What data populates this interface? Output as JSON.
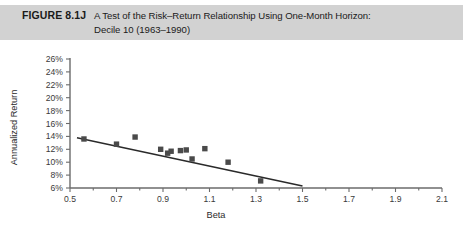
{
  "figure": {
    "number": "FIGURE 8.1J",
    "caption_line1": "A Test of the Risk–Return Relationship Using One-Month Horizon:",
    "caption_line2": "Decile 10 (1963–1990)",
    "header_bg": "#d2d2d2"
  },
  "chart_data": {
    "type": "scatter",
    "title": "A Test of the Risk–Return Relationship Using One-Month Horizon: Decile 10 (1963–1990)",
    "xlabel": "Beta",
    "ylabel": "Annualized Return",
    "xlim": [
      0.5,
      2.1
    ],
    "ylim": [
      6,
      26
    ],
    "grid": false,
    "legend": null,
    "x_ticks": [
      0.5,
      0.7,
      0.9,
      1.1,
      1.3,
      1.5,
      1.7,
      1.9,
      2.1
    ],
    "x_tick_labels": [
      "0.5",
      "0.7",
      "0.9",
      "1.1",
      "1.3",
      "1.5",
      "1.7",
      "1.9",
      "2.1"
    ],
    "x_minor_ticks": [
      0.6,
      0.8,
      1.0,
      1.2,
      1.4,
      1.6,
      1.8,
      2.0
    ],
    "y_ticks": [
      6,
      8,
      10,
      12,
      14,
      16,
      18,
      20,
      22,
      24,
      26
    ],
    "y_tick_labels": [
      "6%",
      "8%",
      "10%",
      "12%",
      "14%",
      "16%",
      "18%",
      "20%",
      "22%",
      "24%",
      "26%"
    ],
    "marker_color": "#4a4a4a",
    "marker_shape": "square",
    "points": [
      {
        "x": 0.56,
        "y": 13.6
      },
      {
        "x": 0.7,
        "y": 12.8
      },
      {
        "x": 0.78,
        "y": 13.9
      },
      {
        "x": 0.89,
        "y": 12.0
      },
      {
        "x": 0.92,
        "y": 11.4
      },
      {
        "x": 0.935,
        "y": 11.7
      },
      {
        "x": 0.975,
        "y": 11.8
      },
      {
        "x": 1.0,
        "y": 11.9
      },
      {
        "x": 1.025,
        "y": 10.5
      },
      {
        "x": 1.08,
        "y": 12.1
      },
      {
        "x": 1.18,
        "y": 10.0
      },
      {
        "x": 1.32,
        "y": 7.1
      }
    ],
    "trend_line": {
      "label": "fitted regression line",
      "x_start": 0.53,
      "y_start": 13.8,
      "x_end": 1.5,
      "y_end": 6.3,
      "color": "#2a2a2a"
    }
  }
}
